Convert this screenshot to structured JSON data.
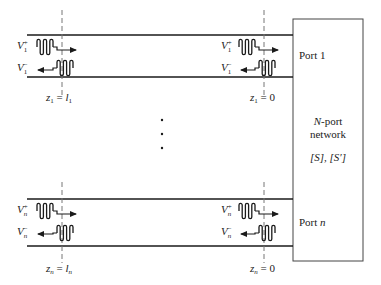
{
  "colors": {
    "line": "#1a1a1a",
    "dash": "#777777",
    "text": "#222222",
    "box": "#444444"
  },
  "network": {
    "title_italic": "N",
    "title_rest": "-port",
    "title_line2": "network",
    "matrices": "[S], [S′]"
  },
  "ports": [
    {
      "port_label_prefix": "Port ",
      "port_label_index": "1",
      "index_italic": false,
      "v_plus_left": {
        "base": "V",
        "sub": "1",
        "sup": "+"
      },
      "v_minus_left": {
        "base": "V",
        "sub": "1",
        "sup": "−"
      },
      "v_plus_right": {
        "base": "V",
        "sub": "1",
        "sup": "+"
      },
      "v_minus_right": {
        "base": "V",
        "sub": "1",
        "sup": "−"
      },
      "z_left": {
        "var": "z",
        "sub": "1",
        "eq": " = ",
        "rhs": "l",
        "rhs_sub": "1"
      },
      "z_right": {
        "var": "z",
        "sub": "1",
        "eq": " = ",
        "rhs": "0"
      }
    },
    {
      "port_label_prefix": "Port ",
      "port_label_index": "n",
      "index_italic": true,
      "v_plus_left": {
        "base": "V",
        "sub": "n",
        "sup": "+"
      },
      "v_minus_left": {
        "base": "V",
        "sub": "n",
        "sup": "−"
      },
      "v_plus_right": {
        "base": "V",
        "sub": "n",
        "sup": "+"
      },
      "v_minus_right": {
        "base": "V",
        "sub": "n",
        "sup": "−"
      },
      "z_left": {
        "var": "z",
        "sub": "n",
        "eq": " = ",
        "rhs": "l",
        "rhs_sub": "n"
      },
      "z_right": {
        "var": "z",
        "sub": "n",
        "eq": " = ",
        "rhs": "0"
      }
    }
  ],
  "ellipsis": "⋮"
}
